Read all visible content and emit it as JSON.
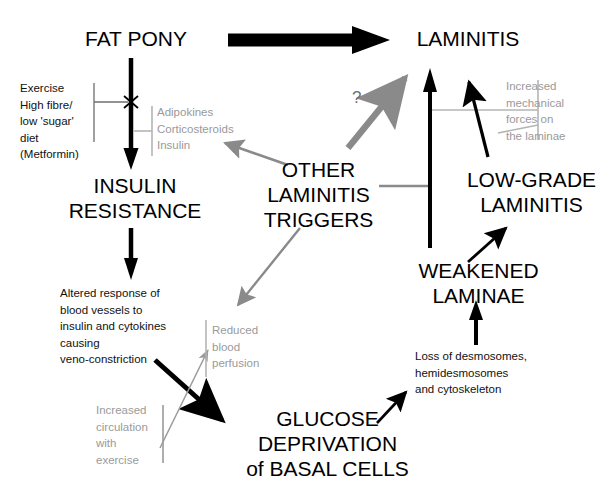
{
  "diagram": {
    "background": "#ffffff",
    "colors": {
      "black": "#000000",
      "gray": "#8c8c8c",
      "light_gray": "#b4b4b4",
      "gray_text": "#9a9a9a",
      "arrow_gray": "#8a8a8a"
    },
    "nodes": {
      "fat_pony": "FAT PONY",
      "laminitis": "LAMINITIS",
      "insulin_resistance_line1": "INSULIN",
      "insulin_resistance_line2": "RESISTANCE",
      "other_triggers_line1": "OTHER",
      "other_triggers_line2": "LAMINITIS",
      "other_triggers_line3": "TRIGGERS",
      "low_grade_line1": "LOW-GRADE",
      "low_grade_line2": "LAMINITIS",
      "weakened_line1": "WEAKENED",
      "weakened_line2": "LAMINAE",
      "glucose_line1": "GLUCOSE",
      "glucose_line2": "DEPRIVATION",
      "glucose_line3": "of BASAL CELLS"
    },
    "annotations": {
      "exercise_diet": "Exercise\nHigh fibre/\nlow 'sugar'\ndiet\n(Metformin)",
      "adipokines": "Adipokines\nCorticosteroids\nInsulin",
      "increased_mechanical": "Increased\nmechanical\nforces on\nthe laminae",
      "altered_response": "Altered response of\nblood vessels to\ninsulin and cytokines\ncausing\nveno-constriction",
      "reduced_perfusion": "Reduced\nblood\nperfusion",
      "increased_circulation": "Increased\ncirculation\nwith\nexercise",
      "loss_desmosomes": "Loss of desmosomes,\nhemidesmosomes\nand cytoskeleton",
      "question_mark": "?"
    },
    "edges": [
      {
        "name": "fat-pony-to-laminitis",
        "style": "thick-black",
        "from": "FAT PONY",
        "to": "LAMINITIS"
      },
      {
        "name": "fat-pony-to-insulin-resistance",
        "style": "black",
        "from": "FAT PONY",
        "to": "INSULIN RESISTANCE",
        "blocked": true
      },
      {
        "name": "insulin-resistance-to-altered-response",
        "style": "black",
        "from": "INSULIN RESISTANCE",
        "to": "Altered response of blood vessels"
      },
      {
        "name": "veno-constriction-to-glucose-deprivation",
        "style": "thick-black",
        "from": "veno-constriction",
        "to": "GLUCOSE DEPRIVATION of BASAL CELLS"
      },
      {
        "name": "exercise-to-reduced-perfusion",
        "style": "gray-thin",
        "from": "Increased circulation with exercise",
        "to": "Reduced blood perfusion"
      },
      {
        "name": "triggers-to-adipokines",
        "style": "gray",
        "from": "OTHER LAMINITIS TRIGGERS",
        "to": "Adipokines / Corticosteroids / Insulin"
      },
      {
        "name": "triggers-to-reduced-perfusion",
        "style": "gray",
        "from": "OTHER LAMINITIS TRIGGERS",
        "to": "Reduced blood perfusion"
      },
      {
        "name": "triggers-to-laminitis-question",
        "style": "gray-thick",
        "from": "OTHER LAMINITIS TRIGGERS",
        "to": "LAMINITIS",
        "label": "?"
      },
      {
        "name": "glucose-to-loss-desmosomes",
        "style": "black",
        "from": "GLUCOSE DEPRIVATION of BASAL CELLS",
        "to": "Loss of desmosomes"
      },
      {
        "name": "loss-desmosomes-to-weakened-laminae",
        "style": "black",
        "from": "Loss of desmosomes",
        "to": "WEAKENED LAMINAE"
      },
      {
        "name": "weakened-laminae-to-laminitis",
        "style": "black",
        "from": "WEAKENED LAMINAE",
        "to": "LAMINITIS"
      },
      {
        "name": "weakened-laminae-to-low-grade-laminitis",
        "style": "black",
        "from": "WEAKENED LAMINAE",
        "to": "LOW-GRADE LAMINITIS"
      },
      {
        "name": "low-grade-laminitis-to-laminitis",
        "style": "black",
        "from": "LOW-GRADE LAMINITIS",
        "to": "LAMINITIS"
      }
    ]
  }
}
